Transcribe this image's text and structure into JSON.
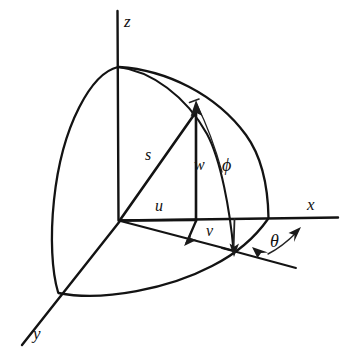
{
  "figure": {
    "ink_color": "#131313",
    "background_color": "#ffffff"
  },
  "axes": [
    {
      "id": "z",
      "label": "z",
      "data_name": "axis-label-z"
    },
    {
      "id": "x",
      "label": "x",
      "data_name": "axis-label-x"
    },
    {
      "id": "y",
      "label": "y",
      "data_name": "axis-label-y"
    }
  ],
  "segments": [
    {
      "id": "s",
      "label": "s",
      "meaning": "radial distance from origin to point"
    },
    {
      "id": "w",
      "label": "w",
      "meaning": "vertical z component"
    },
    {
      "id": "u",
      "label": "u",
      "meaning": "x component"
    },
    {
      "id": "v",
      "label": "v",
      "meaning": "y component"
    }
  ],
  "angles": [
    {
      "id": "phi",
      "label": "ϕ",
      "meaning": "polar angle measured from z axis"
    },
    {
      "id": "theta",
      "label": "θ",
      "meaning": "azimuthal angle measured from x axis"
    }
  ],
  "labels": {
    "z": "z",
    "x": "x",
    "y": "y",
    "s": "s",
    "w": "w",
    "u": "u",
    "v": "v",
    "phi": "ϕ",
    "theta": "θ"
  }
}
